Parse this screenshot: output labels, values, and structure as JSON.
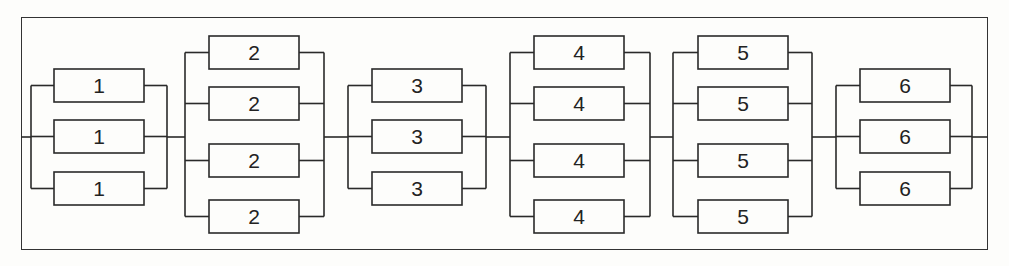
{
  "diagram": {
    "type": "reliability-block-diagram",
    "groups": [
      {
        "label": "1",
        "count": 3
      },
      {
        "label": "2",
        "count": 4
      },
      {
        "label": "3",
        "count": 3
      },
      {
        "label": "4",
        "count": 4
      },
      {
        "label": "5",
        "count": 4
      },
      {
        "label": "6",
        "count": 3
      }
    ]
  },
  "caption": "Figure 5.x"
}
